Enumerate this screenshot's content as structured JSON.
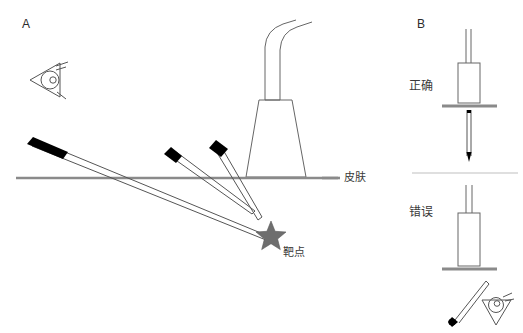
{
  "figure": {
    "width": 523,
    "height": 333,
    "background": "#ffffff"
  },
  "panels": {
    "a": {
      "label": "A",
      "skin_label": "皮肤",
      "target_label": "靶点",
      "eye_icon": "eye-icon",
      "probe_icon": "ultrasound-probe-icon",
      "needle_count": 3,
      "star_icon": "star-target-icon"
    },
    "b": {
      "label": "B",
      "correct_label": "正确",
      "incorrect_label": "错误",
      "probe_icon": "ultrasound-probe-icon",
      "needle_icon": "needle-icon",
      "eye_icon": "eye-icon"
    }
  },
  "colors": {
    "stroke": "#444444",
    "skin_line": "#8a8a8a",
    "needle_hub": "#000000",
    "star_fill": "#6e6e6e",
    "text": "#2b2b2b",
    "divider": "#bfbfbf"
  }
}
